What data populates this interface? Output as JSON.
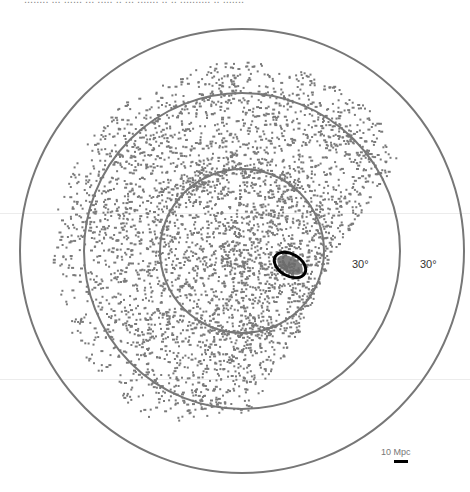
{
  "header": {
    "cut_text": "........ ... ......  ... ..... .. ... ....... .. .. .......... .. .......",
    "cut_text_left": 24
  },
  "figure": {
    "center": {
      "x": 242,
      "y": 251
    },
    "circles": [
      {
        "name": "inner",
        "r": 82,
        "stroke": "#777777",
        "width": 2
      },
      {
        "name": "middle",
        "r": 158,
        "stroke": "#777777",
        "width": 2
      },
      {
        "name": "outer",
        "r": 222,
        "stroke": "#777777",
        "width": 2
      }
    ],
    "angle_labels": [
      {
        "text": "30°",
        "x": 352,
        "y": 258
      },
      {
        "text": "30°",
        "x": 420,
        "y": 258
      }
    ],
    "highlight": {
      "cx": 290,
      "cy": 265,
      "rx": 17,
      "ry": 11,
      "rotate": 30,
      "stroke": "#000000",
      "fill": "#6a6a6a",
      "stroke_width": 3
    },
    "scale_bar": {
      "label": "10 Mpc",
      "label_x": 381,
      "label_y": 447,
      "bar_x": 394,
      "bar_y": 460,
      "bar_w": 14,
      "bar_h": 3
    },
    "points": {
      "color": "#7a7a7a",
      "count": 3200,
      "seed": 1337,
      "footprint_edge": [
        [
          400,
          60
        ],
        [
          405,
          150
        ],
        [
          330,
          255
        ],
        [
          300,
          330
        ],
        [
          250,
          410
        ],
        [
          200,
          420
        ]
      ],
      "min_radius_from_center": 0,
      "max_radius_from_center": 190,
      "clusters": [
        {
          "x": 290,
          "y": 265,
          "n": 60,
          "s": 8
        },
        {
          "x": 235,
          "y": 260,
          "n": 45,
          "s": 10
        },
        {
          "x": 150,
          "y": 330,
          "n": 40,
          "s": 14
        },
        {
          "x": 145,
          "y": 140,
          "n": 40,
          "s": 14
        },
        {
          "x": 225,
          "y": 80,
          "n": 30,
          "s": 14
        },
        {
          "x": 300,
          "y": 75,
          "n": 35,
          "s": 16
        },
        {
          "x": 195,
          "y": 180,
          "n": 35,
          "s": 12
        },
        {
          "x": 110,
          "y": 215,
          "n": 30,
          "s": 14
        },
        {
          "x": 245,
          "y": 325,
          "n": 35,
          "s": 12
        },
        {
          "x": 210,
          "y": 360,
          "n": 25,
          "s": 12
        },
        {
          "x": 340,
          "y": 140,
          "n": 30,
          "s": 12
        },
        {
          "x": 280,
          "y": 190,
          "n": 30,
          "s": 14
        }
      ]
    }
  },
  "faint_lines": [
    213,
    379
  ]
}
